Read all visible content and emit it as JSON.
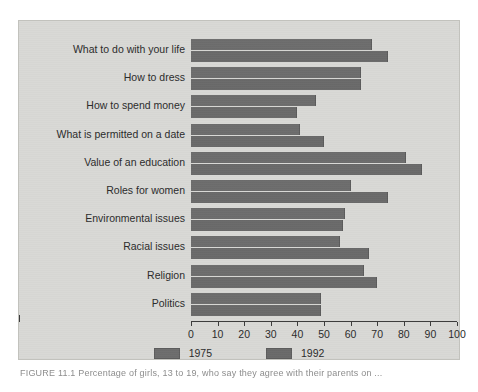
{
  "figure": {
    "caption": "FIGURE 11.1   Percentage of girls, 13 to 19, who say they agree with their parents on ...",
    "bar_color": "#6b6b6b",
    "panel_color": "#d9d9d6"
  },
  "legend": {
    "items": [
      {
        "label": "1975",
        "color": "#6d6d6d",
        "name": "legend-1975"
      },
      {
        "label": "1992",
        "color": "#6a6a6a",
        "name": "legend-1992"
      }
    ]
  },
  "axis": {
    "ticks": [
      "0",
      "10",
      "20",
      "30",
      "40",
      "50",
      "60",
      "70",
      "80",
      "90",
      "100"
    ]
  },
  "chart_data": {
    "type": "bar",
    "orientation": "horizontal",
    "title": "",
    "xlabel": "",
    "ylabel": "",
    "xlim": [
      0,
      100
    ],
    "xticks": [
      0,
      10,
      20,
      30,
      40,
      50,
      60,
      70,
      80,
      90,
      100
    ],
    "grid": false,
    "legend_position": "bottom-center",
    "categories": [
      "What to do with your life",
      "How to dress",
      "How to spend money",
      "What is permitted on a date",
      "Value of an education",
      "Roles for women",
      "Environmental issues",
      "Racial issues",
      "Religion",
      "Politics"
    ],
    "series": [
      {
        "name": "1975",
        "color": "#6d6d6d",
        "values": [
          68,
          64,
          47,
          41,
          81,
          60,
          58,
          56,
          65,
          49
        ]
      },
      {
        "name": "1992",
        "color": "#6a6a6a",
        "values": [
          74,
          64,
          40,
          50,
          87,
          74,
          57,
          67,
          70,
          49
        ]
      }
    ]
  }
}
